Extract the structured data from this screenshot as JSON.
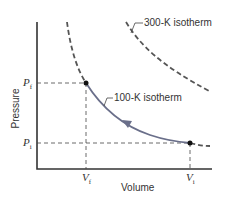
{
  "diagram": {
    "xlabel": "Volume",
    "ylabel": "Pressure",
    "ticks": {
      "pf": {
        "main": "P",
        "sub": "f"
      },
      "pi": {
        "main": "P",
        "sub": "i"
      },
      "vf": {
        "main": "V",
        "sub": "f"
      },
      "vi": {
        "main": "V",
        "sub": "i"
      }
    },
    "labels": {
      "isotherm_300": "300-K isotherm",
      "isotherm_100": "100-K isotherm"
    },
    "colors": {
      "process_curve": "#6a6f8a",
      "isotherm_dashed": "#555555",
      "axes": "#333333"
    }
  }
}
